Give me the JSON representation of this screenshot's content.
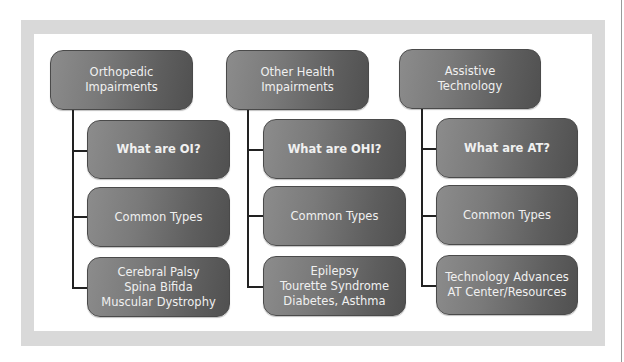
{
  "diagram": {
    "columns": [
      {
        "header": "Orthopedic\nImpairments",
        "children": [
          {
            "label": "What are OI?",
            "bold": true
          },
          {
            "label": "Common Types",
            "bold": false
          },
          {
            "label": "Cerebral Palsy\nSpina Bifida\nMuscular Dystrophy",
            "bold": false
          }
        ]
      },
      {
        "header": "Other Health\nImpairments",
        "children": [
          {
            "label": "What are OHI?",
            "bold": true
          },
          {
            "label": "Common Types",
            "bold": false
          },
          {
            "label": "Epilepsy\nTourette Syndrome\nDiabetes, Asthma",
            "bold": false
          }
        ]
      },
      {
        "header": "Assistive\nTechnology",
        "children": [
          {
            "label": "What are AT?",
            "bold": true
          },
          {
            "label": "Common Types",
            "bold": false
          },
          {
            "label": "Technology Advances\nAT Center/Resources",
            "bold": false
          }
        ]
      }
    ],
    "colors": {
      "box_light": "#8c8c8c",
      "box_dark": "#505050",
      "box_text": "#f0f0f0",
      "frame": "#d9d9d9",
      "connector": "#222222"
    }
  }
}
